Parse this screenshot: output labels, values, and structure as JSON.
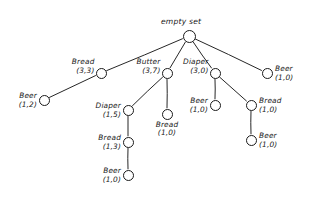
{
  "figure": {
    "title": "empty set",
    "style": "hand-drawn enumeration tree",
    "ink_color": "#1a1a1a",
    "background_color": "#ffffff"
  },
  "chart_data": {
    "type": "diagram",
    "subtype": "tree",
    "title": "empty set",
    "count_format": "(support, value)",
    "nodes": [
      {
        "id": "root",
        "label": "empty set",
        "counts": "",
        "x": 189,
        "y": 36,
        "r": 6.5,
        "label_pos": "above",
        "parent": null
      },
      {
        "id": "bread33",
        "label": "Bread",
        "counts": "(3,3)",
        "x": 101,
        "y": 73,
        "r": 5.5,
        "label_pos": "upper-left",
        "parent": "root"
      },
      {
        "id": "butter37",
        "label": "Butter",
        "counts": "(3,7)",
        "x": 167,
        "y": 73,
        "r": 5.5,
        "label_pos": "upper-left",
        "parent": "root"
      },
      {
        "id": "diaper30",
        "label": "Diaper",
        "counts": "(3,0)",
        "x": 215,
        "y": 73,
        "r": 5.5,
        "label_pos": "upper-left",
        "parent": "root"
      },
      {
        "id": "beer10right",
        "label": "Beer",
        "counts": "(1,0)",
        "x": 267,
        "y": 73,
        "r": 5.5,
        "label_pos": "right",
        "parent": "root"
      },
      {
        "id": "beer12",
        "label": "Beer",
        "counts": "(1,2)",
        "x": 44,
        "y": 100,
        "r": 5.5,
        "label_pos": "left",
        "parent": "bread33"
      },
      {
        "id": "diaper15",
        "label": "Diaper",
        "counts": "(1,5)",
        "x": 128,
        "y": 110,
        "r": 5.5,
        "label_pos": "left",
        "parent": "butter37"
      },
      {
        "id": "bread10mid",
        "label": "Bread",
        "counts": "(1,0)",
        "x": 167,
        "y": 114,
        "r": 5.5,
        "label_pos": "below",
        "parent": "butter37"
      },
      {
        "id": "bread13",
        "label": "Bread",
        "counts": "(1,3)",
        "x": 128,
        "y": 142,
        "r": 5.5,
        "label_pos": "left",
        "parent": "diaper15"
      },
      {
        "id": "beer10deep",
        "label": "Beer",
        "counts": "(1,0)",
        "x": 128,
        "y": 175,
        "r": 5.5,
        "label_pos": "left",
        "parent": "bread13"
      },
      {
        "id": "beer10mid",
        "label": "Beer",
        "counts": "(1,0)",
        "x": 215,
        "y": 105,
        "r": 5.5,
        "label_pos": "left",
        "parent": "diaper30"
      },
      {
        "id": "bread10r",
        "label": "Bread",
        "counts": "(1,0)",
        "x": 251,
        "y": 105,
        "r": 5.5,
        "label_pos": "right",
        "parent": "diaper30"
      },
      {
        "id": "beer10br",
        "label": "Beer",
        "counts": "(1,0)",
        "x": 251,
        "y": 140,
        "r": 5.5,
        "label_pos": "right",
        "parent": "bread10r"
      }
    ],
    "edges": [
      {
        "from": "root",
        "to": "bread33"
      },
      {
        "from": "root",
        "to": "butter37"
      },
      {
        "from": "root",
        "to": "diaper30"
      },
      {
        "from": "root",
        "to": "beer10right"
      },
      {
        "from": "bread33",
        "to": "beer12"
      },
      {
        "from": "butter37",
        "to": "diaper15"
      },
      {
        "from": "butter37",
        "to": "bread10mid"
      },
      {
        "from": "diaper15",
        "to": "bread13"
      },
      {
        "from": "bread13",
        "to": "beer10deep"
      },
      {
        "from": "diaper30",
        "to": "beer10mid"
      },
      {
        "from": "diaper30",
        "to": "bread10r"
      },
      {
        "from": "bread10r",
        "to": "beer10br"
      }
    ]
  }
}
